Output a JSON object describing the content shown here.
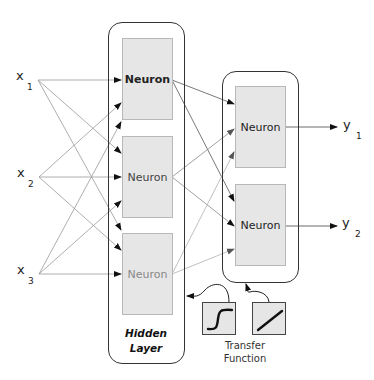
{
  "inputs": [
    {
      "symbol": "x",
      "subscript": "1"
    },
    {
      "symbol": "x",
      "subscript": "2"
    },
    {
      "symbol": "x",
      "subscript": "3"
    }
  ],
  "outputs": [
    {
      "symbol": "y",
      "subscript": "1"
    },
    {
      "symbol": "y",
      "subscript": "2"
    }
  ],
  "hidden_layer": {
    "label_line1": "Hidden",
    "label_line2": "Layer",
    "neurons": [
      {
        "label": "Neuron"
      },
      {
        "label": "Neuron"
      },
      {
        "label": "Neuron"
      }
    ]
  },
  "output_layer": {
    "neurons": [
      {
        "label": "Neuron"
      },
      {
        "label": "Neuron"
      }
    ]
  },
  "transfer_function": {
    "label_line1": "Transfer",
    "label_line2": "Function",
    "functions": [
      "sigmoid-icon",
      "linear-icon"
    ]
  },
  "colors": {
    "neuron_fill": "#e6e6e6",
    "border": "#333333",
    "edge_dark": "#555555",
    "edge_mid": "#888888",
    "edge_light": "#b0b0b0"
  }
}
